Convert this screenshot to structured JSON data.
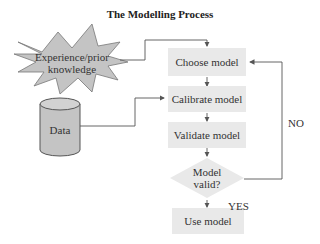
{
  "title": "The Modelling Process",
  "inputs": {
    "experience": {
      "line1": "Experience/prior",
      "line2": "knowledge"
    },
    "data": "Data"
  },
  "steps": {
    "choose": "Choose model",
    "calibrate": "Calibrate model",
    "validate": "Validate model",
    "decision": {
      "line1": "Model",
      "line2": "valid?"
    },
    "use": "Use model"
  },
  "branches": {
    "no": "NO",
    "yes": "YES"
  },
  "colors": {
    "box_fill": "#e9e9e9",
    "shape_fill": "#c4c4c4",
    "line": "#555555"
  }
}
